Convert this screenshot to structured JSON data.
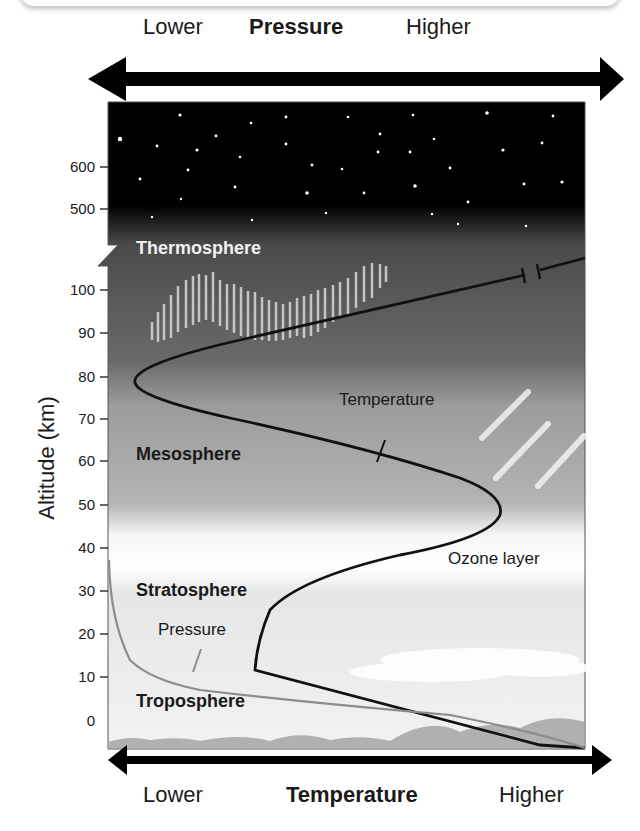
{
  "top_axis": {
    "left_label": "Lower",
    "title": "Pressure",
    "right_label": "Higher"
  },
  "bottom_axis": {
    "left_label": "Lower",
    "title": "Temperature",
    "right_label": "Higher"
  },
  "y_axis": {
    "title": "Altitude (km)",
    "ticks": [
      "600",
      "500",
      "100",
      "90",
      "80",
      "70",
      "60",
      "50",
      "40",
      "30",
      "20",
      "10",
      "0"
    ]
  },
  "layers": {
    "thermosphere": "Thermosphere",
    "mesosphere": "Mesosphere",
    "stratosphere": "Stratosphere",
    "troposphere": "Troposphere"
  },
  "annotations": {
    "temperature": "Temperature",
    "pressure": "Pressure",
    "ozone": "Ozone layer"
  },
  "colors": {
    "sky_top": "#000000",
    "sky_mid": "#5a5a5a",
    "meso": "#a8a8a8",
    "ozone": "#ffffff",
    "strat": "#e6e6e6",
    "temperature_line": "#111111",
    "pressure_line": "#8c8c8c"
  }
}
